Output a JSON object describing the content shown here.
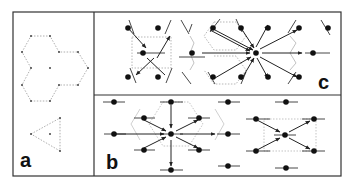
{
  "figure": {
    "panels": [
      {
        "id": "a",
        "label": "a",
        "description": "Dotted honeycomb outline (three hexagons) with centre point, and a dotted triangle with centre point"
      },
      {
        "id": "b",
        "label": "b",
        "description": "Molecular units with arrows converging to a central site; hexagonal and rectangular arrangements"
      },
      {
        "id": "c",
        "label": "c",
        "description": "Tilted molecular units with arrows converging to central site; rectangular and hexagonal arrangements"
      }
    ],
    "colors": {
      "border": "#333333",
      "ink": "#111111",
      "dotted": "#888888",
      "background": "#ffffff"
    }
  }
}
